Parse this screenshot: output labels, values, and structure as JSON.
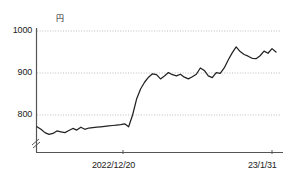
{
  "chart_data": {
    "type": "line",
    "title": "",
    "xlabel": "",
    "ylabel": "円",
    "unit": "円",
    "ylim": [
      740,
      1000
    ],
    "yticks": [
      800,
      900,
      1000
    ],
    "ytick_labels": [
      "800",
      "900",
      "1000"
    ],
    "grid": true,
    "axis_break": true,
    "legend": "none",
    "xticks": [
      "2022/12/20",
      "23/1/31"
    ],
    "xtick_labels": [
      "2022/12/20",
      "23/1/31"
    ],
    "line_color": "#222222",
    "grid_color": "#bbbbbb",
    "axis_color": "#555555",
    "x": [
      0,
      1,
      2,
      3,
      4,
      5,
      6,
      7,
      8,
      9,
      10,
      11,
      12,
      13,
      14,
      15,
      16,
      17,
      18,
      19,
      20,
      21,
      22,
      23,
      24,
      25,
      26,
      27,
      28,
      29,
      30,
      31,
      32,
      33,
      34,
      35,
      36,
      37,
      38,
      39,
      40,
      41,
      42,
      43,
      44,
      45,
      46,
      47,
      48,
      49,
      50,
      51,
      52,
      53,
      54,
      55,
      56,
      57,
      58,
      59,
      60
    ],
    "values": [
      772,
      766,
      758,
      754,
      756,
      762,
      760,
      758,
      763,
      768,
      764,
      771,
      766,
      769,
      770,
      771,
      772,
      773,
      774,
      775,
      776,
      777,
      779,
      772,
      800,
      838,
      862,
      878,
      890,
      898,
      896,
      886,
      893,
      901,
      896,
      893,
      897,
      890,
      886,
      891,
      897,
      912,
      906,
      893,
      889,
      901,
      899,
      912,
      931,
      948,
      962,
      951,
      944,
      940,
      935,
      934,
      941,
      952,
      947,
      958,
      950
    ]
  }
}
